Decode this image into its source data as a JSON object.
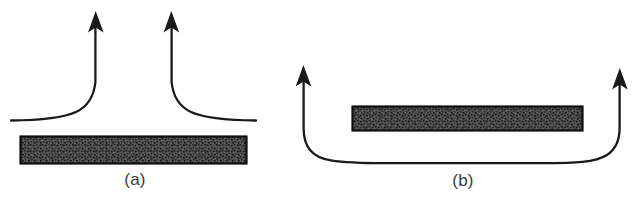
{
  "figure": {
    "background_color": "#ffffff",
    "ink_color": "#1a1a1a",
    "slab_fill_color": "#4a4a4a",
    "slab_border_color": "#111111",
    "caption_color": "#3a3a3a",
    "panels": [
      {
        "id": "a",
        "caption": "(a)",
        "description": "Two upward arrows rising from a horizontal line that curves up above a hatched slab",
        "slab": {
          "x": 20,
          "y": 136,
          "width": 227,
          "height": 28
        },
        "arrows": [
          {
            "name": "left-upward-arrow",
            "tip_x": 96,
            "tip_y": 12
          },
          {
            "name": "right-upward-arrow",
            "tip_x": 155,
            "tip_y": 12
          }
        ],
        "baseline_y": 120,
        "baseline_x_start": 11,
        "baseline_x_end": 256
      },
      {
        "id": "b",
        "caption": "(b)",
        "description": "A single streamline passing under a hatched slab and turning upward at both ends",
        "slab": {
          "x": 67,
          "y": 106,
          "width": 231,
          "height": 25
        },
        "arrows": [
          {
            "name": "left-upward-arrow",
            "tip_x": 18,
            "tip_y": 65
          },
          {
            "name": "right-upward-arrow",
            "tip_x": 335,
            "tip_y": 68
          }
        ],
        "baseline_y": 162,
        "baseline_x_start": 18,
        "baseline_x_end": 335
      }
    ]
  }
}
